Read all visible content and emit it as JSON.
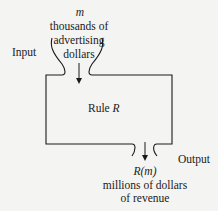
{
  "input": {
    "label": "Input",
    "variable": "m",
    "description_lines": [
      "thousands of",
      "advertising",
      "dollars"
    ]
  },
  "rule": {
    "label": "Rule",
    "name": "R"
  },
  "output": {
    "label": "Output",
    "variable": "R(m)",
    "description_lines": [
      "millions of dollars",
      "of revenue"
    ]
  },
  "colors": {
    "background": "#f4f4f2",
    "stroke": "#1a1a1a"
  }
}
